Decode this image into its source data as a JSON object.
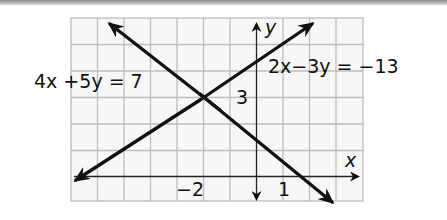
{
  "graph": {
    "grid": {
      "x_min": -7,
      "x_max": 4,
      "y_min": -1,
      "y_max": 6,
      "unit_px": 26.5
    },
    "axes": {
      "x_label": "x",
      "y_label": "y"
    },
    "tick_labels": {
      "x_neg2": "−2",
      "x_1": "1",
      "y_3": "3"
    },
    "equations": {
      "line1": "4x +5y = 7",
      "line2": "2x−3y = −13"
    },
    "intersection": {
      "x": -2,
      "y": 3
    },
    "colors": {
      "grid": "#bdbdbd",
      "line": "#111111",
      "axis": "#222222"
    }
  }
}
